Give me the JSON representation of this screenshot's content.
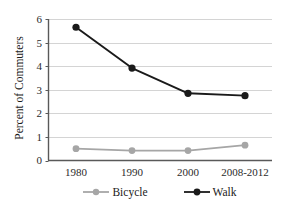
{
  "chart_data": {
    "type": "line",
    "title": "",
    "xlabel": "",
    "ylabel": "Percent of Commuters",
    "categories": [
      "1980",
      "1990",
      "2000",
      "2008-2012"
    ],
    "series": [
      {
        "name": "Bicycle",
        "color": "#a6a6a6",
        "values": [
          0.5,
          0.42,
          0.42,
          0.65
        ]
      },
      {
        "name": "Walk",
        "color": "#1a1a1a",
        "values": [
          5.65,
          3.92,
          2.85,
          2.75
        ]
      }
    ],
    "ylim": [
      0,
      6
    ],
    "yticks": [
      "0",
      "1",
      "2",
      "3",
      "4",
      "5",
      "6"
    ],
    "grid": true,
    "legend_position": "bottom"
  },
  "axes": {
    "y_title": "Percent of Commuters",
    "y_tick_labels": [
      "6",
      "5",
      "4",
      "3",
      "2",
      "1",
      "0"
    ],
    "x_tick_labels": [
      "1980",
      "1990",
      "2000",
      "2008-2012"
    ]
  },
  "legend": {
    "items": [
      {
        "label": "Bicycle",
        "marker": "circle-marker",
        "color": "#a6a6a6"
      },
      {
        "label": "Walk",
        "marker": "circle-marker",
        "color": "#1a1a1a"
      }
    ]
  },
  "colors": {
    "bicycle": "#a6a6a6",
    "walk": "#1a1a1a",
    "grid": "#d4d4d4",
    "axis": "#595959",
    "text": "#1a1a1a"
  }
}
